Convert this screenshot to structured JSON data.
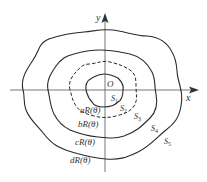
{
  "diagram": {
    "axes": {
      "x_label": "x",
      "y_label": "y",
      "origin_label": "O"
    },
    "curves": [
      {
        "id": "a",
        "label": "aR(θ)",
        "style": "solid"
      },
      {
        "id": "b",
        "label": "bR(θ)",
        "style": "dashed"
      },
      {
        "id": "c",
        "label": "cR(θ)",
        "style": "solid"
      },
      {
        "id": "d",
        "label": "dR(θ)",
        "style": "solid"
      }
    ],
    "regions": [
      {
        "label": "S",
        "sub": "1"
      },
      {
        "label": "S",
        "sub": "2"
      },
      {
        "label": "S",
        "sub": "3"
      },
      {
        "label": "S",
        "sub": "4"
      },
      {
        "label": "S",
        "sub": "5"
      }
    ],
    "colors": {
      "line": "#2a2a2a",
      "axis": "#555555",
      "text": "#333333"
    }
  }
}
